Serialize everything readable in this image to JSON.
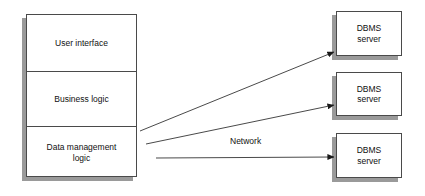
{
  "diagram": {
    "client_stack": {
      "name": "client-application-stack",
      "tiers": [
        {
          "id": "user-interface",
          "label": "User interface"
        },
        {
          "id": "business-logic",
          "label": "Business logic"
        },
        {
          "id": "data-management-logic",
          "label": "Data management\nlogic",
          "line1": "Data management",
          "line2": "logic"
        }
      ]
    },
    "servers": [
      {
        "id": "dbms-server-1",
        "line1": "DBMS",
        "line2": "server"
      },
      {
        "id": "dbms-server-2",
        "line1": "DBMS",
        "line2": "server"
      },
      {
        "id": "dbms-server-3",
        "line1": "DBMS",
        "line2": "server"
      }
    ],
    "network": {
      "label": "Network",
      "connections": [
        {
          "id": "connector-to-server-1",
          "from": "data-management-logic",
          "to": "dbms-server-1"
        },
        {
          "id": "connector-to-server-2",
          "from": "data-management-logic",
          "to": "dbms-server-2"
        },
        {
          "id": "connector-to-server-3",
          "from": "data-management-logic",
          "to": "dbms-server-3"
        }
      ]
    },
    "colors": {
      "box_border": "#4a4a4a",
      "box_fill": "#ffffff",
      "shadow": "#9a9a9a",
      "connector": "#4a4a4a",
      "text": "#111111",
      "background": "#ffffff"
    }
  }
}
